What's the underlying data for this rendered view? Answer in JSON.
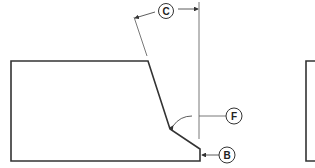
{
  "diagram": {
    "callouts": [
      {
        "id": "C",
        "label": "C",
        "meaning": "bevel angle"
      },
      {
        "id": "F",
        "label": "F",
        "meaning": "groove angle reference"
      },
      {
        "id": "B",
        "label": "B",
        "meaning": "root face"
      }
    ],
    "colors": {
      "line": "#333333",
      "thin": "#555555",
      "background": "#ffffff"
    }
  }
}
